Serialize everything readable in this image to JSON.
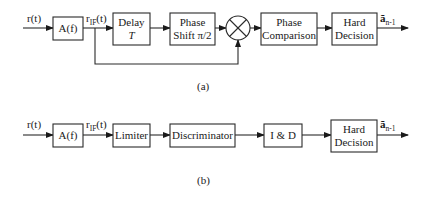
{
  "diagram_a": {
    "caption": "(a)",
    "input_label": "r(t)",
    "if_label_main": "r",
    "if_label_sub": "IF",
    "if_label_tail": "(t)",
    "blocks": [
      {
        "id": "filter",
        "line1": "A(f)"
      },
      {
        "id": "delay",
        "line1": "Delay",
        "line2": "T"
      },
      {
        "id": "phase-shift",
        "line1": "Phase",
        "line2": "Shift π/2"
      },
      {
        "id": "multiplier",
        "symbol": "⊗"
      },
      {
        "id": "phase-comparison",
        "line1": "Phase",
        "line2": "Comparison"
      },
      {
        "id": "hard-decision",
        "line1": "Hard",
        "line2": "Decision"
      }
    ],
    "output_label_main": "ã",
    "output_label_sub": "n-1"
  },
  "diagram_b": {
    "caption": "(b)",
    "input_label": "r(t)",
    "if_label_main": "r",
    "if_label_sub": "IF",
    "if_label_tail": "(t)",
    "blocks": [
      {
        "id": "filter",
        "line1": "A(f)"
      },
      {
        "id": "limiter",
        "line1": "Limiter"
      },
      {
        "id": "discriminator",
        "line1": "Discriminator"
      },
      {
        "id": "integrate-dump",
        "line1": "I & D"
      },
      {
        "id": "hard-decision",
        "line1": "Hard",
        "line2": "Decision"
      }
    ],
    "output_label_main": "ã",
    "output_label_sub": "n-1"
  }
}
